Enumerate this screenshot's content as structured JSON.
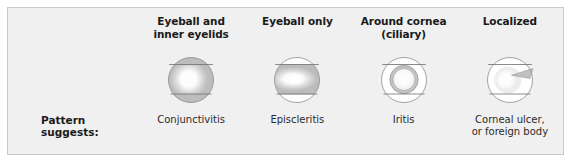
{
  "figure": {
    "row_label": "Pattern suggests:",
    "panel_color": "#f0f0f0",
    "border_color": "#c9c9c9",
    "redness_color": "#b8b8b8",
    "outline_color": "#8c8c8c"
  },
  "columns": [
    {
      "header": "Eyeball and\ninner eyelids",
      "diagnosis": "Conjunctivitis",
      "illustration": "eye-diffuse-all",
      "redness_regions": [
        "eyeball",
        "upper-eyelid",
        "lower-eyelid"
      ]
    },
    {
      "header": "Eyeball only",
      "diagnosis": "Episcleritis",
      "illustration": "eye-eyeball-only",
      "redness_regions": [
        "eyeball"
      ]
    },
    {
      "header": "Around cornea\n(ciliary)",
      "diagnosis": "Iritis",
      "illustration": "eye-ciliary-ring",
      "redness_regions": [
        "ciliary-ring"
      ]
    },
    {
      "header": "Localized",
      "diagnosis": "Corneal ulcer,\nor foreign body",
      "illustration": "eye-localized-wedge",
      "redness_regions": [
        "localized-wedge"
      ]
    }
  ]
}
